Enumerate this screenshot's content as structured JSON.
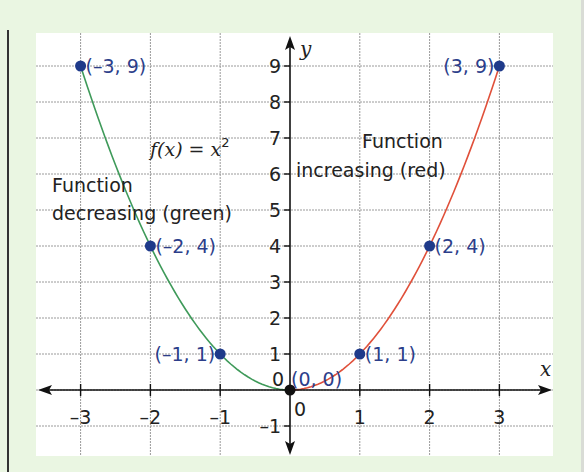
{
  "chart_data": {
    "type": "line",
    "title": "",
    "function_label": {
      "prefix": "f(x) = x",
      "superscript": "2"
    },
    "xlabel": "x",
    "ylabel": "y",
    "xlim": [
      -3.65,
      3.75
    ],
    "ylim": [
      -1.85,
      9.9
    ],
    "grid": true,
    "x_ticks": [
      -3,
      -2,
      -1,
      1,
      2,
      3
    ],
    "x_tick_labels": [
      "–3",
      "–2",
      "–1",
      "1",
      "2",
      "3"
    ],
    "y_ticks": [
      -1,
      1,
      2,
      3,
      4,
      5,
      6,
      7,
      8,
      9
    ],
    "y_tick_labels": [
      "–1",
      "1",
      "2",
      "3",
      "4",
      "5",
      "6",
      "7",
      "8",
      "9"
    ],
    "origin_labels": [
      "0",
      "0"
    ],
    "series": [
      {
        "name": "Function decreasing (green)",
        "color": "#3f9a5a",
        "x_range": [
          -3,
          0
        ],
        "function": "x^2"
      },
      {
        "name": "Function increasing (red)",
        "color": "#e0503a",
        "x_range": [
          0,
          3
        ],
        "function": "x^2"
      }
    ],
    "points": [
      {
        "x": -3,
        "y": 9,
        "label": "(–3, 9)",
        "color": "#1f3a8a",
        "label_side": "right"
      },
      {
        "x": -2,
        "y": 4,
        "label": "(–2, 4)",
        "color": "#1f3a8a",
        "label_side": "right"
      },
      {
        "x": -1,
        "y": 1,
        "label": "(–1, 1)",
        "color": "#1f3a8a",
        "label_side": "left"
      },
      {
        "x": 0,
        "y": 0,
        "label": "(0, 0)",
        "color": "#111111",
        "label_side": "above-right"
      },
      {
        "x": 1,
        "y": 1,
        "label": "(1, 1)",
        "color": "#1f3a8a",
        "label_side": "right"
      },
      {
        "x": 2,
        "y": 4,
        "label": "(2, 4)",
        "color": "#1f3a8a",
        "label_side": "right"
      },
      {
        "x": 3,
        "y": 9,
        "label": "(3, 9)",
        "color": "#1f3a8a",
        "label_side": "left"
      }
    ],
    "annotations": {
      "decreasing": [
        "Function",
        "decreasing (green)"
      ],
      "increasing": [
        "Function",
        "increasing (red)"
      ]
    }
  }
}
